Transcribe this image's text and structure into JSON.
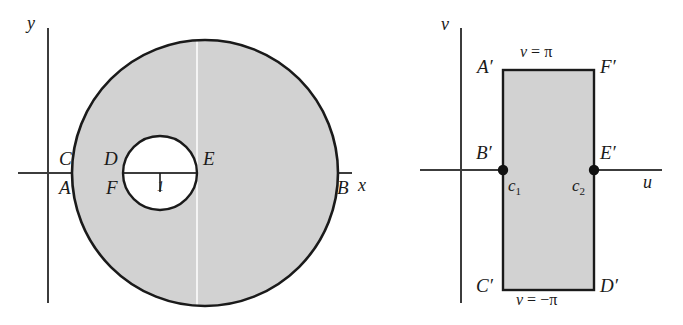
{
  "figure": {
    "type": "diagram",
    "colors": {
      "fill": "#d2d2d2",
      "stroke": "#1a1a1a",
      "axis": "#3c3c3c",
      "cut_line": "#f2f2f2",
      "text": "#1a1a1a"
    }
  },
  "z_plane": {
    "axis_labels": {
      "y": "y",
      "x": "x"
    },
    "points": {
      "C": "C",
      "A": "A",
      "D": "D",
      "F": "F",
      "E": "E",
      "B": "B"
    },
    "radius_label": "1",
    "outer_circle": {
      "cx": 205,
      "cy": 173,
      "r": 133
    },
    "inner_circle": {
      "cx": 160,
      "cy": 173,
      "r": 37
    }
  },
  "w_plane": {
    "axis_labels": {
      "v": "v",
      "u": "u"
    },
    "points": {
      "A_prime": "A",
      "F_prime": "F",
      "B_prime": "B",
      "E_prime": "E",
      "C_prime": "C",
      "D_prime": "D"
    },
    "prime_mark": "′",
    "edge_labels": {
      "top": "v = π",
      "bottom": "v = −π"
    },
    "top_edge_var": "v",
    "top_edge_rest": " = π",
    "bottom_edge_var": "v",
    "bottom_edge_rest": " = −π",
    "cut_points": {
      "c1_base": "c",
      "c1_sub": "1",
      "c2_base": "c",
      "c2_sub": "2"
    },
    "rect": {
      "x": 503,
      "y": 70,
      "width": 91,
      "height": 220
    }
  }
}
